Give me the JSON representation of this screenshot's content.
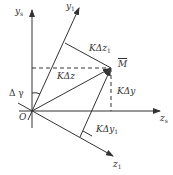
{
  "diagram": {
    "axes": {
      "ys": {
        "label": "y",
        "sub": "s"
      },
      "y1": {
        "label": "y",
        "sub": "1"
      },
      "zs": {
        "label": "z",
        "sub": "s"
      },
      "z1": {
        "label": "z",
        "sub": "1"
      }
    },
    "origin": "O",
    "point": "M",
    "angle": "Δ γ",
    "vectors": {
      "kdz": "KΔz",
      "kdz1": {
        "label": "KΔz",
        "sub": "1"
      },
      "kdy": "KΔy",
      "kdy1": {
        "label": "KΔy",
        "sub": "1"
      }
    },
    "colors": {
      "line": "#333333",
      "background": "#ffffff"
    }
  }
}
